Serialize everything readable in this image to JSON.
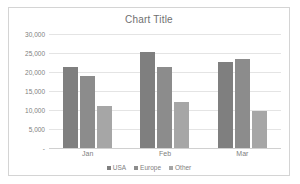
{
  "chart_data": {
    "type": "bar",
    "title": "Chart Title",
    "xlabel": "",
    "ylabel": "",
    "categories": [
      "Jan",
      "Feb",
      "Mar"
    ],
    "series": [
      {
        "name": "USA",
        "color": "#7f7f7f",
        "values": [
          21400,
          25300,
          22700
        ]
      },
      {
        "name": "Europe",
        "color": "#8c8c8c",
        "values": [
          19000,
          21200,
          23500
        ]
      },
      {
        "name": "Other",
        "color": "#a6a6a6",
        "values": [
          11000,
          12200,
          9700
        ]
      }
    ],
    "ylim": [
      0,
      30000
    ],
    "ytick_values": [
      0,
      5000,
      10000,
      15000,
      20000,
      25000,
      30000
    ],
    "ytick_labels": [
      "-",
      "5,000",
      "10,000",
      "15,000",
      "20,000",
      "25,000",
      "30,000"
    ],
    "grid": true,
    "legend_position": "bottom"
  }
}
